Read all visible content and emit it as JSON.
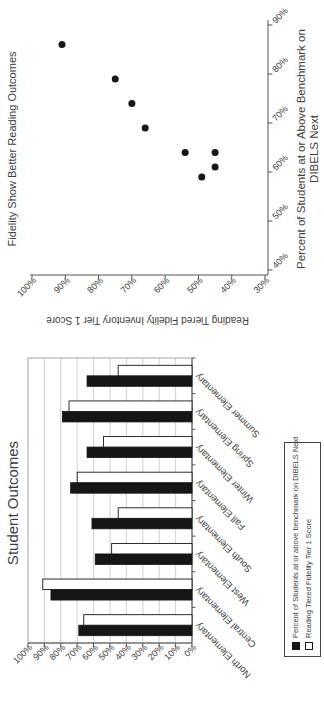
{
  "page": {
    "background": "#ffffff",
    "rotation": "content rotated 90 degrees counter-clockwise"
  },
  "colors": {
    "series_black": "#161616",
    "series_white": "#ffffff",
    "axis": "#555555",
    "grid": "#c3c3c3",
    "plot_border": "#9a9a9a",
    "text": "#3d3d3d"
  },
  "chart_data": [
    {
      "type": "bar",
      "title": "Student Outcomes",
      "categories": [
        "North Elementary",
        "Central Elementary",
        "West Elementary",
        "South Elementary",
        "Fall Elementary",
        "Winter Elementary",
        "Spring Elementary",
        "Summer Elementary"
      ],
      "series": [
        {
          "name": "Percent of Students at or above benchmark on DIBELS Next",
          "color": "#161616",
          "values": [
            69,
            86,
            59,
            61,
            74,
            64,
            79,
            64
          ]
        },
        {
          "name": "Reading Tiered Fidelity Tier 1 Score",
          "color": "#ffffff",
          "values": [
            66,
            91,
            49,
            45,
            70,
            54,
            75,
            45
          ]
        }
      ],
      "ylim": [
        0,
        100
      ],
      "ytick_step": 10,
      "ytick_format": "percent",
      "grid": true,
      "legend_position": "bottom"
    },
    {
      "type": "scatter",
      "title": "Fidelity Show Better Reading Outcomes",
      "xlabel_lines": [
        "Percent of Students at or Above Benchmark on",
        "DIBELS Next"
      ],
      "ylabel": "Reading Tiered Fidelity Inventory Tier 1 Score",
      "xlim": [
        40,
        90
      ],
      "ylim": [
        30,
        100
      ],
      "xtick_step": 10,
      "ytick_step": 10,
      "tick_format": "percent",
      "grid": false,
      "marker": {
        "shape": "circle",
        "color": "#161616"
      },
      "points": [
        {
          "school": "North Elementary",
          "x": 69,
          "y": 66
        },
        {
          "school": "Central Elementary",
          "x": 86,
          "y": 91
        },
        {
          "school": "West Elementary",
          "x": 59,
          "y": 49
        },
        {
          "school": "South Elementary",
          "x": 61,
          "y": 45
        },
        {
          "school": "Fall Elementary",
          "x": 74,
          "y": 70
        },
        {
          "school": "Winter Elementary",
          "x": 64,
          "y": 54
        },
        {
          "school": "Spring Elementary",
          "x": 79,
          "y": 75
        },
        {
          "school": "Summer Elementary",
          "x": 64,
          "y": 45
        }
      ]
    }
  ]
}
